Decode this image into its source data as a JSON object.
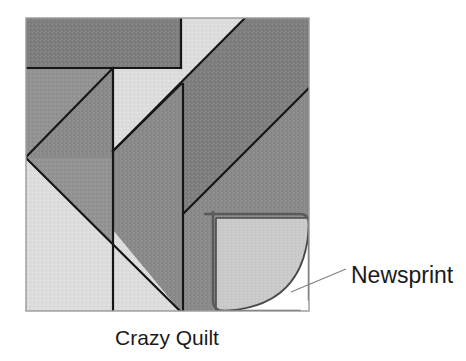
{
  "figure": {
    "title": "Crazy Quilt",
    "caption_label": "Crazy Quilt",
    "annotation_label": "Newsprint",
    "background_color": "#ffffff",
    "frame": {
      "x": 26,
      "y": 18,
      "width": 283,
      "height": 293,
      "border_color": "#9a9a9a"
    },
    "palette": {
      "dark_gray": "#7f7f7f",
      "medium_gray": "#8a8a8a",
      "mid_gray": "#939393",
      "light_gray": "#d9d9d9",
      "pale_gray": "#c9c9c9",
      "paper_white": "#ffffff",
      "seam_color": "#161616",
      "curl_edge_color": "#4a4a4a",
      "leader_color": "#808080",
      "text_color": "#1a1a1a"
    },
    "patches": [
      {
        "name": "top-band-dark",
        "fill_key": "dark_gray",
        "points": "26,18 181,18 181,68 26,68"
      },
      {
        "name": "upper-left-mid",
        "fill_key": "medium_gray",
        "points": "26,68 113,68 113,160 26,160"
      },
      {
        "name": "left-diagonal-wedge",
        "fill_key": "mid_gray",
        "points": "26,68 113,68 113,160 26,160"
      },
      {
        "name": "left-lower-light-triangle",
        "fill_key": "light_gray",
        "points": "26,160 26,311 177,311"
      },
      {
        "name": "center-light-triangle",
        "fill_key": "light_gray",
        "points": "113,68 181,68 181,84 113,152"
      },
      {
        "name": "top-right-light-band",
        "fill_key": "light_gray",
        "points": "181,18 245,18 115,148 115,84 181,18"
      },
      {
        "name": "upper-right-dark-band",
        "fill_key": "dark_gray",
        "points": "245,18 309,18 309,88 183,214 183,144"
      },
      {
        "name": "right-lower-dark",
        "fill_key": "medium_gray",
        "points": "309,88 309,218 216,218 216,311 183,311 183,214"
      },
      {
        "name": "center-vertical-dark",
        "fill_key": "mid_gray",
        "points": "113,152 183,214 183,311 113,311"
      },
      {
        "name": "curl-under-flap",
        "fill_key": "pale_gray",
        "points": "216,218 309,311 216,311"
      }
    ],
    "seams": [
      {
        "name": "seam-top-horizontal",
        "points": "26,68 181,68"
      },
      {
        "name": "seam-upper-vertical",
        "points": "181,18 181,68"
      },
      {
        "name": "seam-left-diagonal",
        "points": "113,68 26,155"
      },
      {
        "name": "seam-center-vertical",
        "points": "113,68 113,311"
      },
      {
        "name": "seam-center-diagonal",
        "points": "113,152 183,84"
      },
      {
        "name": "seam-mid-vertical",
        "points": "183,84 183,311"
      },
      {
        "name": "seam-long-diagonal",
        "points": "245,18 115,148"
      },
      {
        "name": "seam-lower-right-diagonal",
        "points": "309,88 183,214"
      },
      {
        "name": "seam-left-lower-diagonal",
        "points": "26,160 177,311"
      }
    ],
    "curl": {
      "name": "page-curl",
      "corner_x": 309,
      "corner_y": 311,
      "flap_top_x": 216,
      "flap_top_y": 218
    },
    "leader_line": {
      "name": "newsprint-leader",
      "x1": 291,
      "y1": 292,
      "x2": 345,
      "y2": 270
    },
    "annotation_position": {
      "x": 351,
      "y": 283
    },
    "caption_position": {
      "x": 167,
      "y": 344
    }
  }
}
